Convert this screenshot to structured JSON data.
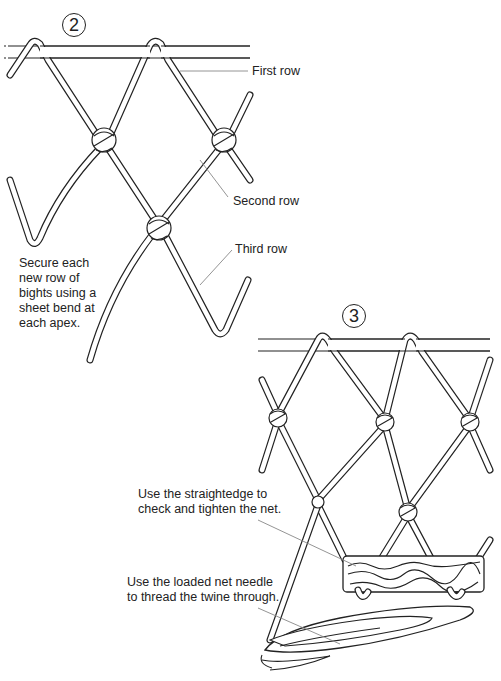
{
  "panels": [
    {
      "step": "2",
      "labels": {
        "first_row": "First row",
        "second_row": "Second row",
        "third_row": "Third row"
      },
      "caption_lines": [
        "Secure each",
        "new row of",
        "bights using a",
        "sheet bend at",
        "each apex."
      ]
    },
    {
      "step": "3",
      "labels": {
        "straightedge_line1": "Use the straightedge to",
        "straightedge_line2": "check and tighten the net.",
        "needle_line1": "Use the loaded net needle",
        "needle_line2": "to thread the twine through."
      }
    }
  ],
  "colors": {
    "ink": "#222222",
    "leader": "#888888",
    "background": "#ffffff"
  }
}
